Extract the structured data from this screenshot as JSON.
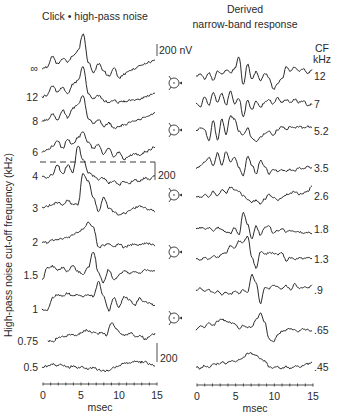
{
  "chart_data": [
    {
      "type": "line",
      "title": "Click • high-pass noise",
      "xlabel": "msec",
      "ylabel": "High-pass noise cut-off frequency (kHz)",
      "xlim": [
        0,
        15
      ],
      "xticks": [
        "0",
        "5",
        "10",
        "15"
      ],
      "scale_bars": [
        {
          "label": "200 nV"
        },
        {
          "label": "200"
        },
        {
          "label": "200"
        }
      ],
      "reference_line": {
        "style": "dashed",
        "between": [
          "6",
          "4"
        ]
      },
      "series": [
        {
          "name": "∞",
          "peak_ms": 5.3,
          "peak_amp": 1.0,
          "profile": [
            0,
            0.05,
            0.35,
            0.15,
            0.3,
            0.2,
            0.35,
            0.5,
            1.0,
            0.2,
            -0.1,
            0.15,
            -0.05,
            -0.2,
            0.05,
            -0.25,
            -0.15,
            -0.05,
            0.0,
            0.1,
            0.15,
            0.2,
            0.25
          ]
        },
        {
          "name": "12",
          "peak_ms": 5.3,
          "peak_amp": 0.85,
          "profile": [
            0,
            0.05,
            0.3,
            0.15,
            0.25,
            0.1,
            0.35,
            0.45,
            0.85,
            0.1,
            -0.05,
            0.05,
            -0.1,
            -0.15,
            -0.1,
            -0.15,
            -0.12,
            -0.1,
            -0.08,
            -0.05,
            0.0,
            0.05,
            0.08
          ]
        },
        {
          "name": "8",
          "peak_ms": 5.6,
          "peak_amp": 0.7,
          "profile": [
            0,
            0.02,
            0.2,
            0.05,
            0.3,
            0.1,
            0.35,
            0.45,
            0.7,
            0.05,
            -0.05,
            0.05,
            -0.15,
            -0.05,
            -0.2,
            -0.15,
            -0.1,
            -0.05,
            0.0,
            0.05,
            0.1,
            0.15,
            0.25
          ]
        },
        {
          "name": "6",
          "peak_ms": 6.0,
          "peak_amp": 0.55,
          "profile": [
            0,
            0.05,
            0.15,
            0.3,
            0.1,
            0.35,
            0.2,
            0.4,
            0.55,
            0.25,
            0.1,
            0.2,
            -0.05,
            0.1,
            -0.15,
            0.0,
            -0.2,
            -0.1,
            -0.05,
            -0.1,
            0.0,
            0.05,
            0.15
          ]
        },
        {
          "name": "4",
          "peak_ms": 6.4,
          "peak_amp": 0.85,
          "profile": [
            0,
            -0.05,
            0.05,
            0.3,
            0.05,
            0.3,
            0.1,
            0.85,
            0.45,
            0.1,
            0.0,
            -0.1,
            -0.05,
            -0.2,
            -0.15,
            -0.25,
            -0.15,
            -0.2,
            -0.1,
            -0.15,
            -0.05,
            -0.1,
            0.0
          ]
        },
        {
          "name": "3",
          "peak_ms": 7.0,
          "peak_amp": 0.95,
          "profile": [
            0,
            0.05,
            0.1,
            0.15,
            0.1,
            0.2,
            0.1,
            0.1,
            0.95,
            0.75,
            0.3,
            -0.1,
            0.3,
            0.0,
            -0.1,
            -0.2,
            -0.15,
            -0.1,
            0.0,
            0.05,
            0.0,
            -0.05,
            -0.1
          ]
        },
        {
          "name": "2",
          "peak_ms": 7.5,
          "peak_amp": 0.55,
          "profile": [
            0,
            -0.02,
            0.05,
            0.05,
            0.1,
            0.12,
            0.2,
            0.25,
            0.35,
            0.55,
            0.4,
            -0.15,
            -0.1,
            -0.05,
            -0.15,
            -0.05,
            -0.15,
            -0.1,
            -0.05,
            -0.1,
            -0.05,
            -0.05,
            -0.1
          ]
        },
        {
          "name": "1.5",
          "peak_ms": 8.0,
          "peak_amp": 0.65,
          "profile": [
            -0.15,
            0.2,
            0.25,
            0.15,
            0.2,
            0.1,
            0.25,
            0.1,
            0.0,
            0.2,
            0.65,
            0.05,
            -0.2,
            0.15,
            -0.15,
            0.0,
            0.1,
            0.05,
            0.1,
            0.05,
            0.15,
            0.1,
            0.1
          ]
        },
        {
          "name": "1",
          "peak_ms": 8.5,
          "peak_amp": 0.75,
          "profile": [
            0,
            -0.05,
            0.3,
            0.4,
            0.35,
            0.45,
            0.35,
            0.4,
            0.35,
            0.4,
            0.35,
            0.75,
            0.35,
            -0.05,
            0.3,
            0.05,
            0.35,
            0.25,
            0.1,
            0.3,
            0.2,
            0.15,
            0.1
          ]
        },
        {
          "name": "0.75",
          "peak_ms": 9.7,
          "peak_amp": 0.5,
          "profile": [
            0,
            -0.02,
            0.1,
            0.12,
            0.15,
            0.2,
            0.15,
            0.25,
            0.3,
            0.25,
            0.2,
            0.25,
            0.15,
            0.5,
            0.35,
            0.2,
            0.15,
            0.25,
            0.1,
            0.15,
            0.05,
            0.15,
            0.2
          ]
        },
        {
          "name": "0.5",
          "peak_ms": 13.0,
          "peak_amp": 0.25,
          "profile": [
            0,
            0.02,
            0.08,
            0.03,
            0.06,
            -0.02,
            0.02,
            -0.03,
            0.0,
            -0.05,
            -0.02,
            -0.08,
            -0.12,
            -0.1,
            -0.02,
            0.05,
            0.1,
            0.12,
            0.15,
            0.13,
            0.15,
            0.08,
            0.02
          ]
        }
      ]
    },
    {
      "type": "line",
      "title": "Derived narrow-band response",
      "legend_header": [
        "CF",
        "kHz"
      ],
      "xlabel": "msec",
      "xlim": [
        0,
        15
      ],
      "xticks": [
        "0",
        "5",
        "10",
        "15"
      ],
      "series": [
        {
          "name": "12",
          "profile": [
            0,
            0.05,
            -0.1,
            0.1,
            -0.15,
            0.15,
            0.05,
            0.2,
            0.1,
            0.25,
            0.65,
            -0.3,
            0.4,
            -0.1,
            0.15,
            -0.15,
            0.1,
            -0.05,
            -0.45,
            -0.25,
            -0.1,
            0.3,
            0.15,
            0.3,
            0.15,
            0.25,
            0.1,
            0.2
          ]
        },
        {
          "name": "7",
          "profile": [
            0,
            -0.1,
            0.25,
            -0.05,
            0.4,
            0.05,
            0.35,
            -0.05,
            0.45,
            0.0,
            0.2,
            -0.45,
            0.15,
            -0.2,
            0.1,
            -0.1,
            0.05,
            0.15,
            0.0,
            0.2,
            0.05,
            0.15,
            0.05,
            0.15,
            0.05,
            0.1,
            -0.05,
            0.0
          ]
        },
        {
          "name": "5.2",
          "profile": [
            0,
            0.1,
            0.05,
            -0.35,
            0.35,
            -0.3,
            0.4,
            -0.1,
            0.5,
            0.4,
            0.0,
            -0.15,
            0.1,
            -0.25,
            -0.35,
            -0.2,
            -0.1,
            0.0,
            -0.15,
            0.05,
            0.15,
            0.05,
            0.15,
            0.1,
            0.15,
            0.1,
            0.15,
            0.1
          ]
        },
        {
          "name": "3.5",
          "profile": [
            0,
            0.05,
            0.2,
            0.35,
            0.05,
            0.5,
            0.1,
            0.55,
            0.2,
            0.35,
            0.0,
            -0.25,
            0.4,
            0.1,
            -0.2,
            0.25,
            0.05,
            -0.2,
            -0.05,
            -0.1,
            -0.05,
            -0.1,
            -0.05,
            -0.1,
            0.0,
            -0.05,
            0.05,
            0.0
          ]
        },
        {
          "name": "2.6",
          "profile": [
            0,
            -0.05,
            0.05,
            -0.05,
            0.15,
            0.0,
            0.2,
            0.1,
            0.3,
            0.2,
            0.15,
            0.0,
            -0.1,
            -0.2,
            -0.15,
            -0.25,
            -0.1,
            0.05,
            -0.05,
            -0.15,
            -0.05,
            0.05,
            0.1,
            0.15,
            0.05,
            0.1,
            0.15,
            0.35
          ]
        },
        {
          "name": "1.8",
          "profile": [
            0,
            0.05,
            0.0,
            0.05,
            -0.05,
            0.05,
            0.0,
            -0.1,
            -0.15,
            0.05,
            -0.2,
            0.55,
            0.15,
            -0.35,
            0.1,
            -0.2,
            0.05,
            0.1,
            -0.15,
            -0.05,
            0.0,
            -0.1,
            -0.05,
            -0.1,
            -0.1,
            -0.15,
            -0.1,
            -0.15
          ]
        },
        {
          "name": "1.3",
          "profile": [
            0,
            -0.05,
            0.05,
            0.0,
            0.1,
            0.05,
            0.15,
            0.2,
            0.45,
            0.35,
            0.6,
            0.55,
            0.75,
            0.05,
            -0.3,
            0.25,
            0.15,
            0.2,
            0.2,
            0.15,
            0.2,
            -0.05,
            0.05,
            0.0,
            0.05,
            0.0,
            0.05,
            0.0
          ]
        },
        {
          "name": ".9",
          "profile": [
            0,
            0.05,
            -0.05,
            0.0,
            -0.1,
            -0.05,
            -0.15,
            -0.1,
            -0.15,
            -0.05,
            -0.1,
            0.0,
            -0.1,
            0.5,
            0.25,
            -0.45,
            0.1,
            0.05,
            0.15,
            0.1,
            0.05,
            0.15,
            0.0,
            0.2,
            0.05,
            0.1,
            0.05,
            0.15
          ]
        },
        {
          "name": ".65",
          "profile": [
            0,
            0.15,
            0.1,
            0.25,
            0.15,
            0.3,
            0.35,
            0.3,
            0.25,
            0.2,
            0.05,
            0.15,
            0.1,
            0.1,
            0.35,
            0.55,
            0.25,
            -0.3,
            -0.4,
            -0.15,
            -0.05,
            0.0,
            0.05,
            0.0,
            -0.05,
            0.05,
            0.0,
            -0.05
          ]
        },
        {
          "name": ".45",
          "profile": [
            0,
            -0.05,
            0.05,
            0.0,
            0.08,
            0.1,
            0.15,
            0.12,
            0.2,
            0.18,
            0.25,
            0.3,
            0.45,
            0.45,
            0.38,
            0.28,
            0.2,
            0.02,
            -0.02,
            0.0,
            -0.05,
            0.02,
            -0.05,
            0.03,
            0.0,
            0.05,
            0.1,
            0.15
          ]
        }
      ]
    }
  ],
  "icons": [
    "head-icon",
    "head-icon",
    "head-icon",
    "head-icon",
    "head-icon"
  ]
}
